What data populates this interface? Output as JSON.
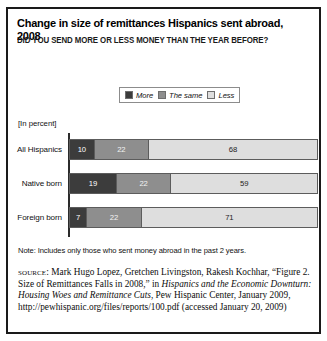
{
  "figure": {
    "title": "Change in size of remittances Hispanics sent abroad, 2008",
    "subtitle": "DID YOU SEND MORE OR LESS MONEY THAN THE YEAR BEFORE?",
    "units_label": "[In percent]",
    "note": "Note: Includes only those who sent money abroad in the past 2 years.",
    "source_lead": "source:",
    "source_part1": " Mark Hugo Lopez, Gretchen Livingston, Rakesh Kochhar, “Figure 2. Size of Remittances Falls in 2008,” in ",
    "source_italic": "Hispanics and the Economic Downturn: Housing Woes and Remittance Cuts",
    "source_part2": ", Pew Hispanic Center, January 2009, http://pewhispanic.org/files/reports/100.pdf (accessed January 20, 2009)"
  },
  "legend": {
    "items": [
      {
        "label": "More",
        "color": "#3c3c3c"
      },
      {
        "label": "The same",
        "color": "#8e8e8e"
      },
      {
        "label": "Less",
        "color": "#dedede"
      }
    ]
  },
  "chart_data": {
    "type": "bar",
    "orientation": "horizontal",
    "stacked": true,
    "title": "Change in size of remittances Hispanics sent abroad, 2008",
    "subtitle": "DID YOU SEND MORE OR LESS MONEY THAN THE YEAR BEFORE?",
    "xlabel": "",
    "ylabel": "",
    "units": "percent",
    "xlim": [
      0,
      100
    ],
    "grid": false,
    "legend_position": "top",
    "categories": [
      "All Hispanics",
      "Native born",
      "Foreign born"
    ],
    "series": [
      {
        "name": "More",
        "color": "#3c3c3c",
        "values": [
          10,
          19,
          7
        ]
      },
      {
        "name": "The same",
        "color": "#8e8e8e",
        "values": [
          22,
          22,
          22
        ]
      },
      {
        "name": "Less",
        "color": "#dedede",
        "values": [
          68,
          59,
          71
        ]
      }
    ],
    "rows": [
      {
        "category": "All Hispanics",
        "segments": [
          {
            "name": "More",
            "value": 10,
            "label": "10"
          },
          {
            "name": "The same",
            "value": 22,
            "label": "22"
          },
          {
            "name": "Less",
            "value": 68,
            "label": "68"
          }
        ]
      },
      {
        "category": "Native born",
        "segments": [
          {
            "name": "More",
            "value": 19,
            "label": "19"
          },
          {
            "name": "The same",
            "value": 22,
            "label": "22"
          },
          {
            "name": "Less",
            "value": 59,
            "label": "59"
          }
        ]
      },
      {
        "category": "Foreign born",
        "segments": [
          {
            "name": "More",
            "value": 7,
            "label": "7"
          },
          {
            "name": "The same",
            "value": 22,
            "label": "22"
          },
          {
            "name": "Less",
            "value": 71,
            "label": "71"
          }
        ]
      }
    ]
  }
}
